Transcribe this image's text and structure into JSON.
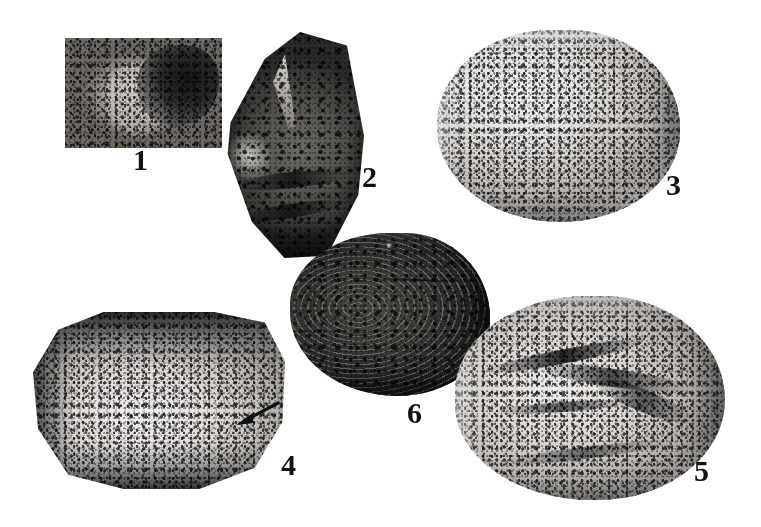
{
  "plate": {
    "title": "Fossil specimen plate",
    "background_color": "#ffffff",
    "width": 761,
    "height": 527,
    "label_color": "#121212"
  },
  "figures": [
    {
      "number": "1",
      "shape": "rectangle",
      "tone": "medium-gray",
      "description": "Rectangular field photograph showing a rounded shell impression in matrix, dark shadow at upper right",
      "label_position": {
        "x": 133,
        "y": 145
      },
      "bounds": {
        "x": 65,
        "y": 38,
        "w": 157,
        "h": 110
      }
    },
    {
      "number": "2",
      "shape": "irregular-polygon",
      "tone": "dark",
      "description": "Tall dark elongate specimen with a pale spine-like projection near the top and concentric ridges below",
      "label_position": {
        "x": 362,
        "y": 162
      },
      "bounds": {
        "x": 222,
        "y": 32,
        "w": 142,
        "h": 226
      }
    },
    {
      "number": "3",
      "shape": "rounded-oval",
      "tone": "light",
      "description": "Pale granular rounded valve, coarse speckled surface, shading toward lower right",
      "label_position": {
        "x": 666,
        "y": 170
      },
      "bounds": {
        "x": 437,
        "y": 30,
        "w": 243,
        "h": 192
      }
    },
    {
      "number": "4",
      "shape": "octagon",
      "tone": "light",
      "description": "Octagonally trimmed pale valve with concentric growth lines, dark matrix band along top and bottom, arrow annotation at right",
      "label_position": {
        "x": 281,
        "y": 450
      },
      "bounds": {
        "x": 33,
        "y": 312,
        "w": 252,
        "h": 177
      },
      "annotation": {
        "type": "arrow",
        "points_to": "growth-line feature on right side of valve",
        "tail": {
          "x": 277,
          "y": 403
        },
        "tip": {
          "x": 236,
          "y": 425
        }
      }
    },
    {
      "number": "5",
      "shape": "ovoid",
      "tone": "light",
      "description": "Pale ovoid valve with strong dark diagonal fracture streaks across the surface",
      "label_position": {
        "x": 694,
        "y": 456
      },
      "bounds": {
        "x": 455,
        "y": 296,
        "w": 270,
        "h": 204
      }
    },
    {
      "number": "6",
      "shape": "rounded-oval",
      "tone": "dark",
      "description": "Dark rounded valve showing pronounced concentric growth lines and a straight hinge line",
      "label_position": {
        "x": 407,
        "y": 398
      },
      "bounds": {
        "x": 290,
        "y": 233,
        "w": 200,
        "h": 163
      }
    }
  ]
}
